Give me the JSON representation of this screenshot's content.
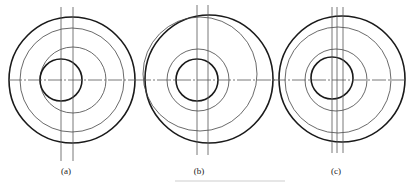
{
  "figure": {
    "panels": [
      {
        "id": "a",
        "label": "(a)",
        "label_pos": [
          66,
          173
        ],
        "outer_thick": {
          "cx": 72,
          "cy": 80,
          "r": 63
        },
        "thin_large": {
          "cx": 72,
          "cy": 80,
          "r": 52
        },
        "thin_mid": {
          "cx": 73,
          "cy": 80,
          "r": 33
        },
        "inner_thick": {
          "cx": 61,
          "cy": 80,
          "r": 21
        },
        "vlines": [
          61,
          73
        ],
        "vline_range": [
          7,
          161
        ],
        "hline": {
          "y": 80,
          "x1": 8,
          "x2": 137
        }
      },
      {
        "id": "b",
        "label": "(b)",
        "label_pos": [
          199,
          173
        ],
        "outer_thick": {
          "cx": 209,
          "cy": 79,
          "r": 64
        },
        "thin_large": {
          "cx": 200,
          "cy": 74,
          "r": 57
        },
        "thin_mid": {
          "cx": 198,
          "cy": 80,
          "r": 31
        },
        "inner_thick": {
          "cx": 197,
          "cy": 80,
          "r": 21
        },
        "vlines": [
          197,
          208
        ],
        "vline_range": [
          5,
          155
        ],
        "hline": {
          "y": 80,
          "x1": 137,
          "x2": 276
        }
      },
      {
        "id": "c",
        "label": "(c)",
        "label_pos": [
          336,
          173
        ],
        "outer_thick": {
          "cx": 342,
          "cy": 79,
          "r": 63
        },
        "thin_large": {
          "cx": 338,
          "cy": 80,
          "r": 53
        },
        "thin_mid": {
          "cx": 336,
          "cy": 80,
          "r": 31
        },
        "inner_thick": {
          "cx": 332,
          "cy": 78,
          "r": 21
        },
        "vlines": [
          332,
          337,
          343
        ],
        "vline_range": [
          7,
          153
        ],
        "hline": {
          "y": 80,
          "x1": 272,
          "x2": 408
        }
      }
    ],
    "colors": {
      "thick": "#1a1a1a",
      "thin": "#444444",
      "center": "#555555"
    }
  }
}
